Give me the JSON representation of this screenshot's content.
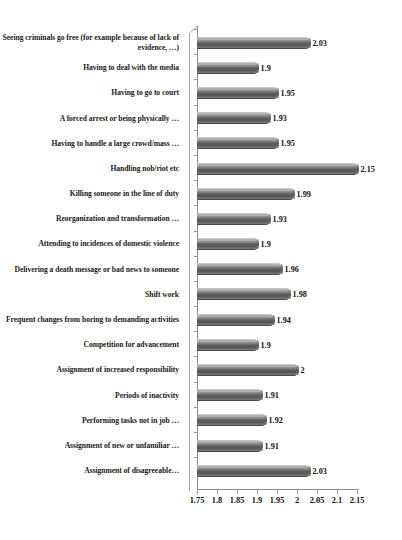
{
  "chart_data": {
    "type": "bar",
    "orientation": "horizontal",
    "title": "",
    "subtitle": "",
    "xlabel": "",
    "ylabel": "",
    "xlim": [
      1.75,
      2.15
    ],
    "grid": false,
    "legend": false,
    "legend_position": "none",
    "bar_color": "#6e6e6e",
    "axis_color": "#8a8a8a",
    "text_color": "#111111",
    "background": "#ffffff",
    "xticks": [
      "1.75",
      "1.8",
      "1.85",
      "1.9",
      "1.95",
      "2",
      "2.05",
      "2.1",
      "2.15"
    ],
    "xtick_values": [
      1.75,
      1.8,
      1.85,
      1.9,
      1.95,
      2,
      2.05,
      2.1,
      2.15
    ],
    "categories": [
      "Seeing criminals go free (for example because of lack of evidence, …)",
      "Having to deal with the media",
      "Having to go to court",
      "A forced arrest or being physically …",
      "Having to handle a large crowd/mass …",
      "Handling nob/riot etc",
      "Killing someone in the line of duty",
      "Reorganization and transformation …",
      "Attending to incidences of domestic violence",
      "Delivering a death message or bad news to someone",
      "Shift work",
      "Frequent changes from boring to demanding activities",
      "Competition for advancement",
      "Assignment of increased responsibility",
      "Periods of inactivity",
      "Performing tasks not in job …",
      "Assignment of new or unfamiliar …",
      "Assignment of disagreeable…"
    ],
    "values": [
      2.03,
      1.9,
      1.95,
      1.93,
      1.95,
      2.15,
      1.99,
      1.93,
      1.9,
      1.96,
      1.98,
      1.94,
      1.9,
      2,
      1.91,
      1.92,
      1.91,
      2.03
    ],
    "value_labels": [
      "2.03",
      "1.9",
      "1.95",
      "1.93",
      "1.95",
      "2.15",
      "1.99",
      "1.93",
      "1.9",
      "1.96",
      "1.98",
      "1.94",
      "1.9",
      "2",
      "1.91",
      "1.92",
      "1.91",
      "2.03"
    ]
  }
}
